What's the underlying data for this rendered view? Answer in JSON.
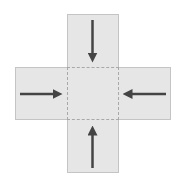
{
  "diagram": {
    "colors": {
      "fill": "#e6e6e6",
      "border": "#c4c4c4",
      "center_dash": "#a8a8a8",
      "arrow": "#444444",
      "background": "#ffffff"
    },
    "panels": [
      {
        "id": "top",
        "x": 67,
        "y": 14,
        "w": 52,
        "h": 54
      },
      {
        "id": "left",
        "x": 15,
        "y": 67,
        "w": 53,
        "h": 53
      },
      {
        "id": "right",
        "x": 118,
        "y": 67,
        "w": 53,
        "h": 53
      },
      {
        "id": "bottom",
        "x": 67,
        "y": 119,
        "w": 52,
        "h": 54
      }
    ],
    "center": {
      "x": 67,
      "y": 67,
      "w": 52,
      "h": 53
    },
    "arrows": [
      {
        "id": "down",
        "direction": "down",
        "x1": 92.5,
        "y1": 20,
        "x2": 92.5,
        "y2": 62
      },
      {
        "id": "right",
        "direction": "right",
        "x1": 20,
        "y1": 94,
        "x2": 62,
        "y2": 94
      },
      {
        "id": "left",
        "direction": "left",
        "x1": 166,
        "y1": 94,
        "x2": 123,
        "y2": 94
      },
      {
        "id": "up",
        "direction": "up",
        "x1": 92.5,
        "y1": 168,
        "x2": 92.5,
        "y2": 126
      }
    ]
  }
}
